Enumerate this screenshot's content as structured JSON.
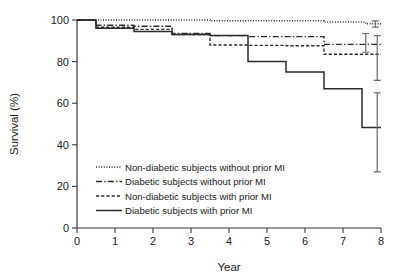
{
  "chart_data": {
    "type": "line",
    "title": "",
    "xlabel": "Year",
    "ylabel": "Survival (%)",
    "xlim": [
      0,
      8
    ],
    "ylim": [
      0,
      100
    ],
    "xticks": [
      0,
      1,
      2,
      3,
      4,
      5,
      6,
      7,
      8
    ],
    "xtick_labels": [
      "0",
      "1",
      "2",
      "3",
      "4",
      "5",
      "6",
      "7",
      "8"
    ],
    "yticks": [
      0,
      20,
      40,
      60,
      80,
      100
    ],
    "ytick_labels": [
      "0",
      "20",
      "40",
      "60",
      "80",
      "100"
    ],
    "grid": false,
    "legend_position": "lower-left-inside",
    "step_style": "post",
    "series": [
      {
        "name": "Non-diabetic subjects without prior MI",
        "line_style": "dotted",
        "color": "#2b2b2b",
        "x": [
          0,
          0.5,
          1.5,
          2.5,
          3.5,
          6.5,
          7.6,
          8
        ],
        "y": [
          100,
          100,
          100,
          100,
          99.6,
          99.0,
          98.2,
          98.2
        ],
        "final_value": 98.2,
        "error_bar": {
          "x": 7.85,
          "low": 96.6,
          "high": 99.6
        }
      },
      {
        "name": "Diabetic subjects without prior MI",
        "line_style": "dash-dot",
        "color": "#2b2b2b",
        "x": [
          0,
          0.5,
          1.5,
          2.5,
          3.5,
          4.5,
          5.5,
          6.5,
          8
        ],
        "y": [
          100,
          97.5,
          97.0,
          93.5,
          92.5,
          92.0,
          92.0,
          88.3,
          88.3
        ],
        "final_value": 88.3,
        "error_bar": {
          "x": 7.6,
          "low": 84.5,
          "high": 93.5
        }
      },
      {
        "name": "Non-diabetic subjects with prior MI",
        "line_style": "dashed",
        "color": "#2b2b2b",
        "x": [
          0,
          0.5,
          1.5,
          2.5,
          3.5,
          4.5,
          5.5,
          6.5,
          8
        ],
        "y": [
          100,
          96.5,
          95.5,
          93.0,
          88.0,
          87.8,
          87.6,
          83.5,
          83.5
        ],
        "final_value": 83.5,
        "error_bar": {
          "x": 7.9,
          "low": 71.0,
          "high": 92.5
        }
      },
      {
        "name": "Diabetic subjects with prior MI",
        "line_style": "solid",
        "color": "#2b2b2b",
        "x": [
          0,
          0.5,
          1.5,
          2.5,
          3.5,
          4.5,
          5.5,
          6.5,
          7.5,
          8
        ],
        "y": [
          100,
          96.0,
          94.5,
          93.0,
          92.5,
          80.0,
          75.0,
          67.0,
          48.3,
          48.3
        ],
        "final_value": 48.3,
        "error_bar": {
          "x": 7.9,
          "low": 27.0,
          "high": 65.0
        }
      }
    ]
  },
  "legend": {
    "entries": [
      {
        "label": "Non-diabetic subjects without prior MI",
        "style": "dotted"
      },
      {
        "label": "Diabetic subjects without prior MI",
        "style": "dash-dot"
      },
      {
        "label": "Non-diabetic subjects with prior MI",
        "style": "dashed"
      },
      {
        "label": "Diabetic subjects with prior MI",
        "style": "solid"
      }
    ]
  }
}
